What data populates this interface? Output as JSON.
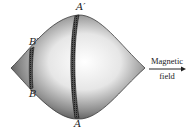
{
  "diagram": {
    "labels": {
      "a_prime": "A′",
      "a": "A",
      "b_prime": "B′",
      "b": "B"
    },
    "field_label": {
      "line1": "Magnetic",
      "line2": "field"
    },
    "colors": {
      "surface_dark": "#4a4a4a",
      "surface_light": "#f2f2f2",
      "band": "#2a2a2a"
    }
  }
}
